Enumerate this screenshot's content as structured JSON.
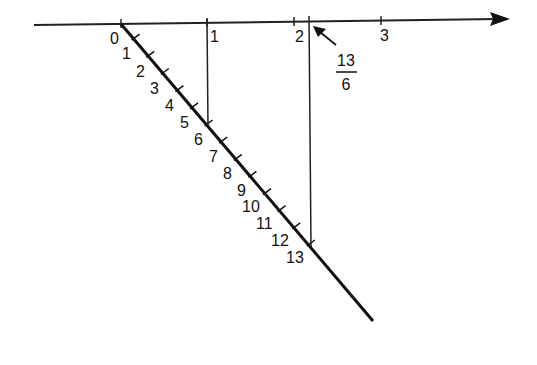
{
  "diagram": {
    "number_line": {
      "tick_labels": [
        "0",
        "1",
        "2",
        "3"
      ],
      "has_arrow": true
    },
    "auxiliary_line": {
      "tick_labels": [
        "0",
        "1",
        "2",
        "3",
        "4",
        "5",
        "6",
        "7",
        "8",
        "9",
        "10",
        "11",
        "12",
        "13"
      ]
    },
    "projections": [
      {
        "from_point": "6",
        "to_value": "1"
      },
      {
        "from_point": "13",
        "to_value": "13/6"
      }
    ],
    "annotation": {
      "numerator": "13",
      "denominator": "6"
    },
    "colors": {
      "line": "#111111",
      "background": "#ffffff"
    }
  }
}
